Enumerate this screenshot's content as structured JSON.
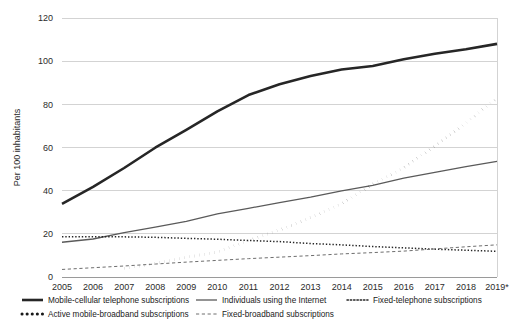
{
  "chart_data": {
    "type": "line",
    "title": "",
    "subtitle": "",
    "xlabel": "",
    "ylabel": "Per 100 inhabitants",
    "ylim": [
      0,
      120
    ],
    "yticks": [
      0,
      20,
      40,
      60,
      80,
      100,
      120
    ],
    "ytick_labels": [
      "0",
      "20",
      "40",
      "60",
      "80",
      "100",
      "120"
    ],
    "grid": true,
    "legend_position": "bottom",
    "x": [
      2005,
      2006,
      2007,
      2008,
      2009,
      2010,
      2011,
      2012,
      2013,
      2014,
      2015,
      2016,
      2017,
      2018,
      2019
    ],
    "categories": [
      "2005",
      "2006",
      "2007",
      "2008",
      "2009",
      "2010",
      "2011",
      "2012",
      "2013",
      "2014",
      "2015",
      "2016",
      "2017",
      "2018",
      "2019*"
    ],
    "series": [
      {
        "name": "Mobile-cellular telephone subscriptions",
        "style": "solid-thick",
        "color": "#262626",
        "values": [
          33.9,
          41.8,
          50.5,
          59.9,
          68.2,
          76.7,
          84.3,
          89.3,
          93.1,
          96.1,
          97.8,
          100.9,
          103.4,
          105.5,
          108.0
        ]
      },
      {
        "name": "Individuals using the Internet",
        "style": "solid-thin",
        "color": "#5a5a5a",
        "values": [
          16.1,
          17.6,
          20.6,
          23.1,
          25.8,
          29.2,
          31.8,
          34.5,
          37.0,
          39.9,
          42.5,
          45.8,
          48.5,
          51.1,
          53.6
        ]
      },
      {
        "name": "Fixed-telephone subscriptions",
        "style": "dotted-fine",
        "color": "#262626",
        "values": [
          18.7,
          18.7,
          18.6,
          18.4,
          17.9,
          17.5,
          16.9,
          16.4,
          15.5,
          14.9,
          14.1,
          13.5,
          12.9,
          12.4,
          11.9
        ]
      },
      {
        "name": "Active mobile-broadband subscriptions",
        "style": "dotted-thick",
        "color": "#1a1a1a",
        "values": [
          null,
          null,
          4.0,
          6.3,
          9.1,
          11.6,
          16.9,
          21.8,
          27.5,
          34.0,
          43.0,
          50.5,
          60.9,
          71.4,
          83.0
        ]
      },
      {
        "name": "Fixed-broadband subscriptions",
        "style": "dashed-fine",
        "color": "#6e6e6e",
        "values": [
          3.5,
          4.3,
          5.1,
          6.0,
          6.9,
          7.7,
          8.5,
          9.2,
          9.9,
          10.7,
          11.3,
          12.0,
          13.0,
          14.0,
          14.9
        ]
      }
    ]
  },
  "axis": {
    "y_title": "Per 100 inhabitants",
    "y_tick_labels": [
      "120",
      "100",
      "80",
      "60",
      "40",
      "20",
      "0"
    ],
    "x_tick_labels": [
      "2005",
      "2006",
      "2007",
      "2008",
      "2009",
      "2010",
      "2011",
      "2012",
      "2013",
      "2014",
      "2015",
      "2016",
      "2017",
      "2018",
      "2019*"
    ]
  },
  "legend": {
    "items": [
      {
        "label": "Mobile-cellular telephone subscriptions",
        "style": "solid-thick",
        "color": "#262626"
      },
      {
        "label": "Individuals using the Internet",
        "style": "solid-thin",
        "color": "#5a5a5a"
      },
      {
        "label": "Fixed-telephone subscriptions",
        "style": "dotted-fine",
        "color": "#262626"
      },
      {
        "label": "Active mobile-broadband subscriptions",
        "style": "dotted-thick",
        "color": "#1a1a1a"
      },
      {
        "label": "Fixed-broadband subscriptions",
        "style": "dashed-fine",
        "color": "#6e6e6e"
      }
    ]
  },
  "colors": {
    "background": "#ffffff",
    "grid": "#c8c8c8",
    "text": "#1a1a1a"
  }
}
